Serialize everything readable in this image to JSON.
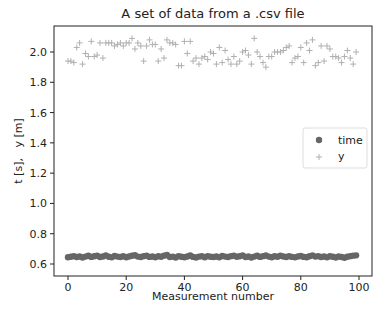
{
  "chart_data": {
    "type": "scatter",
    "title": "A set of data from a .csv file",
    "xlabel": "Measurement number",
    "ylabel": "t [s],   y [m]",
    "xlim": [
      -5,
      104
    ],
    "ylim": [
      0.58,
      2.17
    ],
    "xticks": [
      0,
      20,
      40,
      60,
      80,
      100
    ],
    "xtick_labels": [
      "0",
      "20",
      "40",
      "60",
      "80",
      "100"
    ],
    "yticks": [
      0.6,
      0.8,
      1.0,
      1.2,
      1.4,
      1.6,
      1.8,
      2.0
    ],
    "ytick_labels": [
      "0.6",
      "0.8",
      "1.0",
      "1.2",
      "1.4",
      "1.6",
      "1.8",
      "2.0"
    ],
    "grid": false,
    "legend_position": "center right",
    "series": [
      {
        "name": "time",
        "marker": "circle",
        "color": "#666666",
        "x": [
          0,
          1,
          2,
          3,
          4,
          5,
          6,
          7,
          8,
          9,
          10,
          11,
          12,
          13,
          14,
          15,
          16,
          17,
          18,
          19,
          20,
          21,
          22,
          23,
          24,
          25,
          26,
          27,
          28,
          29,
          30,
          31,
          32,
          33,
          34,
          35,
          36,
          37,
          38,
          39,
          40,
          41,
          42,
          43,
          44,
          45,
          46,
          47,
          48,
          49,
          50,
          51,
          52,
          53,
          54,
          55,
          56,
          57,
          58,
          59,
          60,
          61,
          62,
          63,
          64,
          65,
          66,
          67,
          68,
          69,
          70,
          71,
          72,
          73,
          74,
          75,
          76,
          77,
          78,
          79,
          80,
          81,
          82,
          83,
          84,
          85,
          86,
          87,
          88,
          89,
          90,
          91,
          92,
          93,
          94,
          95,
          96,
          97,
          98,
          99
        ],
        "values": [
          0.645,
          0.648,
          0.652,
          0.646,
          0.65,
          0.643,
          0.649,
          0.654,
          0.647,
          0.651,
          0.655,
          0.646,
          0.65,
          0.657,
          0.648,
          0.644,
          0.653,
          0.649,
          0.646,
          0.651,
          0.645,
          0.65,
          0.654,
          0.658,
          0.649,
          0.646,
          0.652,
          0.655,
          0.647,
          0.65,
          0.644,
          0.651,
          0.648,
          0.655,
          0.659,
          0.646,
          0.649,
          0.643,
          0.652,
          0.648,
          0.645,
          0.65,
          0.656,
          0.647,
          0.643,
          0.649,
          0.651,
          0.645,
          0.652,
          0.648,
          0.646,
          0.65,
          0.644,
          0.653,
          0.649,
          0.646,
          0.652,
          0.655,
          0.648,
          0.651,
          0.657,
          0.646,
          0.65,
          0.643,
          0.649,
          0.654,
          0.647,
          0.652,
          0.656,
          0.649,
          0.645,
          0.651,
          0.648,
          0.654,
          0.65,
          0.646,
          0.652,
          0.647,
          0.644,
          0.65,
          0.653,
          0.647,
          0.645,
          0.651,
          0.657,
          0.649,
          0.652,
          0.646,
          0.65,
          0.644,
          0.651,
          0.648,
          0.643,
          0.65,
          0.646,
          0.641,
          0.648,
          0.652,
          0.655,
          0.657
        ]
      },
      {
        "name": "y",
        "marker": "plus",
        "color": "#b0b0b0",
        "x": [
          0,
          1,
          2,
          3,
          4,
          5,
          6,
          7,
          8,
          9,
          10,
          11,
          12,
          13,
          14,
          15,
          16,
          17,
          18,
          19,
          20,
          21,
          22,
          23,
          24,
          25,
          26,
          27,
          28,
          29,
          30,
          31,
          32,
          33,
          34,
          35,
          36,
          37,
          38,
          39,
          40,
          41,
          42,
          43,
          44,
          45,
          46,
          47,
          48,
          49,
          50,
          51,
          52,
          53,
          54,
          55,
          56,
          57,
          58,
          59,
          60,
          61,
          62,
          63,
          64,
          65,
          66,
          67,
          68,
          69,
          70,
          71,
          72,
          73,
          74,
          75,
          76,
          77,
          78,
          79,
          80,
          81,
          82,
          83,
          84,
          85,
          86,
          87,
          88,
          89,
          90,
          91,
          92,
          93,
          94,
          95,
          96,
          97,
          98,
          99
        ],
        "values": [
          1.94,
          1.94,
          1.93,
          2.03,
          2.06,
          1.92,
          1.99,
          1.97,
          2.07,
          1.97,
          1.98,
          2.06,
          1.96,
          2.06,
          2.06,
          2.06,
          2.04,
          2.05,
          2.06,
          2.04,
          2.06,
          2.06,
          2.09,
          2.02,
          2.06,
          2.04,
          1.94,
          2.04,
          2.08,
          2.05,
          2.05,
          1.94,
          2.02,
          1.96,
          2.08,
          2.06,
          2.06,
          2.05,
          1.91,
          1.91,
          2.07,
          1.99,
          2.07,
          1.94,
          1.96,
          1.92,
          1.96,
          1.97,
          1.95,
          2.0,
          1.99,
          1.92,
          2.03,
          1.93,
          2.01,
          1.95,
          1.92,
          1.97,
          1.92,
          1.94,
          2.0,
          2.01,
          1.98,
          1.92,
          2.09,
          2.0,
          1.97,
          1.93,
          1.9,
          1.97,
          1.97,
          2.0,
          2.0,
          2.0,
          2.01,
          2.03,
          2.04,
          1.93,
          1.96,
          1.97,
          2.03,
          1.93,
          2.06,
          2.01,
          2.08,
          1.91,
          1.93,
          2.04,
          1.94,
          2.04,
          2.02,
          1.97,
          1.97,
          1.96,
          1.93,
          1.97,
          2.01,
          1.96,
          1.92,
          2.0
        ]
      }
    ]
  }
}
